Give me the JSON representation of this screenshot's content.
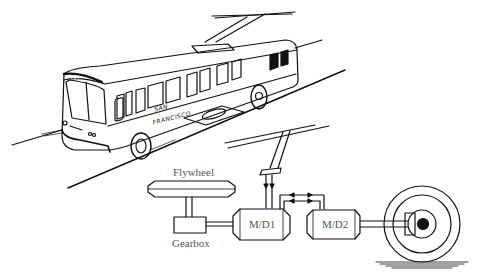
{
  "diagram": {
    "illustration": {
      "bus_number": "417",
      "side_text_line1": "SAN",
      "side_text_line2": "FRANCISCO"
    },
    "schematic": {
      "components": [
        {
          "id": "flywheel",
          "label": "Flywheel"
        },
        {
          "id": "gearbox",
          "label": "Gearbox"
        },
        {
          "id": "md1",
          "label": "M/D1"
        },
        {
          "id": "md2",
          "label": "M/D2"
        },
        {
          "id": "wheel",
          "label": ""
        },
        {
          "id": "overhead-lines",
          "label": ""
        },
        {
          "id": "current-collector",
          "label": ""
        }
      ],
      "connections": [
        {
          "from": "flywheel",
          "to": "gearbox",
          "type": "shaft"
        },
        {
          "from": "gearbox",
          "to": "md1",
          "type": "shaft"
        },
        {
          "from": "overhead-lines",
          "to": "md1",
          "type": "electrical",
          "direction": "down"
        },
        {
          "from": "md1",
          "to": "md2",
          "type": "electrical",
          "direction": "bidirectional"
        },
        {
          "from": "md2",
          "to": "wheel",
          "type": "shaft"
        }
      ]
    },
    "colors": {
      "line": "#111111",
      "label": "#555555",
      "background": "#ffffff"
    }
  }
}
